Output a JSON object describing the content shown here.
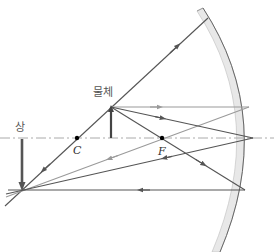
{
  "diagram": {
    "labels": {
      "object": "물체",
      "image": "상",
      "center_of_curvature": "C",
      "focal_point": "F"
    },
    "colors": {
      "dark_ray": "#555555",
      "light_ray": "#9a9a9a",
      "axis": "#aaaaaa",
      "mirror_line": "#666666",
      "mirror_fill": "#e6e6e6",
      "object_arrow": "#444444",
      "image_arrow": "#555555"
    }
  }
}
